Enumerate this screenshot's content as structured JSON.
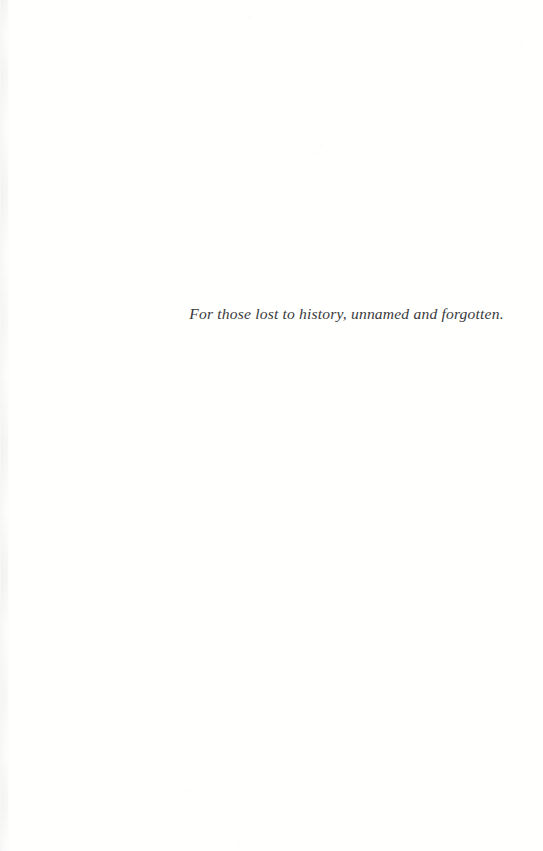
{
  "page": {
    "kind": "book-dedication-page",
    "background_color": "#fffffe",
    "width": 543,
    "height": 851
  },
  "dedication": {
    "text": "For those lost to history, unnamed and forgotten.",
    "text_color": "#3a3a3c",
    "style": "italic-serif",
    "alignment": "centered"
  },
  "artifacts": {
    "gutter_shadow_color": "#f7f7f8"
  }
}
